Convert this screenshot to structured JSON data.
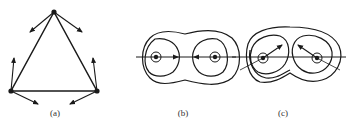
{
  "figure": {
    "panels": [
      {
        "id": "a",
        "label": "(a)",
        "description": "Triangle of three point vortices with velocity arrows at each vertex",
        "vertices": [
          [
            54,
            12
          ],
          [
            11,
            91
          ],
          [
            97,
            91
          ]
        ],
        "arrows": [
          {
            "from": [
              54,
              12
            ],
            "to": [
              30,
              32
            ]
          },
          {
            "from": [
              54,
              12
            ],
            "to": [
              82,
              32
            ]
          },
          {
            "from": [
              11,
              91
            ],
            "to": [
              14,
              58
            ]
          },
          {
            "from": [
              11,
              91
            ],
            "to": [
              38,
              104
            ]
          },
          {
            "from": [
              97,
              91
            ],
            "to": [
              93,
              58
            ]
          },
          {
            "from": [
              97,
              91
            ],
            "to": [
              70,
              104
            ]
          }
        ]
      },
      {
        "id": "b",
        "label": "(b)",
        "description": "Two co-rotating vortices with streamline contours, arrows pointing inward along axis",
        "centers": [
          [
            156,
            57
          ],
          [
            215,
            57
          ]
        ],
        "axis_arrows": [
          {
            "at": [
              178,
              57
            ],
            "direction": "right"
          },
          {
            "at": [
              196,
              57
            ],
            "direction": "left"
          }
        ]
      },
      {
        "id": "c",
        "label": "(c)",
        "description": "Two vortices with streamline contours, arrows pointing diagonally inward-upward",
        "centers": [
          [
            263,
            58
          ],
          [
            317,
            58
          ]
        ],
        "arrows": [
          {
            "from": [
              263,
              58
            ],
            "to": [
              282,
              45
            ]
          },
          {
            "from": [
              317,
              58
            ],
            "to": [
              298,
              45
            ]
          }
        ]
      }
    ],
    "colors": {
      "ink": "#1a1a1a",
      "background": "#ffffff"
    }
  }
}
